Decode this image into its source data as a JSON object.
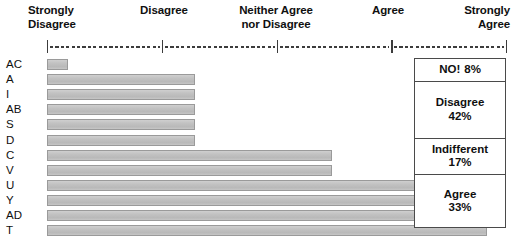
{
  "chart_data": {
    "type": "bar",
    "title": "",
    "xlabel": "",
    "ylabel": "",
    "orientation": "horizontal",
    "xlim": [
      0,
      5
    ],
    "grid": false,
    "axis_ticks": [
      1,
      2,
      3,
      4,
      5
    ],
    "axis_tick_labels": [
      "Strongly\nDisagree",
      "Disagree",
      "Neither Agree\nnor Disagree",
      "Agree",
      "Strongly\nAgree"
    ],
    "categories": [
      "AC",
      "A",
      "I",
      "AB",
      "S",
      "D",
      "C",
      "V",
      "U",
      "Y",
      "AD",
      "T"
    ],
    "values": [
      1.1,
      2.2,
      2.2,
      2.2,
      2.2,
      2.2,
      3.4,
      3.4,
      4.75,
      4.75,
      4.75,
      4.75
    ],
    "legend_position": "right",
    "summary_title": "",
    "summary": [
      {
        "label": "NO!",
        "value": "8%",
        "inline": true
      },
      {
        "label": "Disagree",
        "value": "42%",
        "inline": false
      },
      {
        "label": "Indifferent",
        "value": "17%",
        "inline": false
      },
      {
        "label": "Agree",
        "value": "33%",
        "inline": false
      }
    ]
  },
  "scale": {
    "items": [
      {
        "id": "strongly-disagree",
        "line1": "Strongly",
        "line2": "Disagree"
      },
      {
        "id": "disagree",
        "line1": "Disagree",
        "line2": ""
      },
      {
        "id": "neither",
        "line1": "Neither Agree",
        "line2": "nor Disagree"
      },
      {
        "id": "agree",
        "line1": "Agree",
        "line2": ""
      },
      {
        "id": "strongly-agree",
        "line1": "Strongly",
        "line2": "Agree"
      }
    ]
  },
  "colors": {
    "bar_fill": "#c2c2c2",
    "bar_border": "#9a9a9a",
    "axis": "#3c3c3c",
    "box_border": "#4a4a4a",
    "text": "#101010",
    "background": "#ffffff"
  }
}
